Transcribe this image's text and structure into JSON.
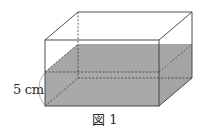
{
  "figure": {
    "caption": "図 1",
    "height_label": "5 cm",
    "shape": "rectangular-prism-container",
    "water_fill_color": "#a9a9a9",
    "edge_color": "#3a3a3a",
    "hidden_edge_style": "dashed"
  }
}
